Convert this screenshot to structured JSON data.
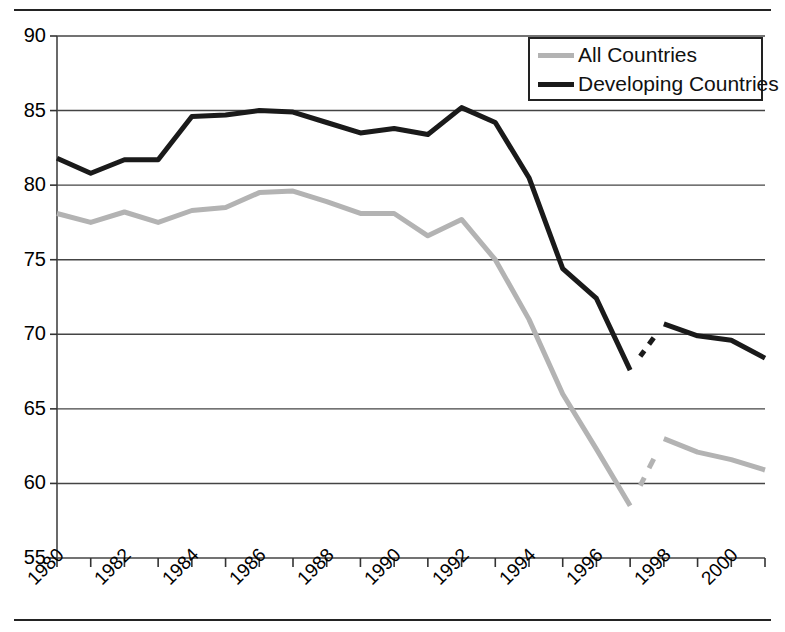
{
  "chart_data": {
    "type": "line",
    "title": "",
    "subtitle": "",
    "xlabel": "",
    "ylabel": "",
    "xlim": [
      1980,
      2001
    ],
    "ylim": [
      55,
      90
    ],
    "ytick_step": 5,
    "yticks": [
      55,
      60,
      65,
      70,
      75,
      80,
      85,
      90
    ],
    "xticks": [
      1980,
      1981,
      1982,
      1983,
      1984,
      1985,
      1986,
      1987,
      1988,
      1989,
      1990,
      1991,
      1992,
      1993,
      1994,
      1995,
      1996,
      1997,
      1998,
      1999,
      2000,
      2001
    ],
    "xtick_labels": [
      "1980",
      "1982",
      "1984",
      "1986",
      "1988",
      "1990",
      "1992",
      "1994",
      "1996",
      "1998",
      "2000"
    ],
    "xtick_labels_years": [
      1980,
      1982,
      1984,
      1986,
      1988,
      1990,
      1992,
      1994,
      1996,
      1998,
      2000
    ],
    "grid": "horizontal",
    "legend_position": "top-right",
    "series": [
      {
        "name": "All Countries",
        "color": "#b3b3b3",
        "linewidth": 5,
        "x": [
          1980,
          1981,
          1982,
          1983,
          1984,
          1985,
          1986,
          1987,
          1988,
          1989,
          1990,
          1991,
          1992,
          1993,
          1994,
          1995,
          1996,
          1997
        ],
        "values": [
          78.1,
          77.5,
          78.2,
          77.5,
          78.3,
          78.5,
          79.5,
          79.6,
          78.9,
          78.1,
          78.1,
          76.6,
          77.7,
          75.0,
          71.0,
          66.0,
          62.3,
          58.5
        ]
      },
      {
        "name": "All Countries (break)",
        "color": "#b3b3b3",
        "linewidth": 5,
        "x": [
          1998,
          1999,
          2000,
          2001
        ],
        "values": [
          63.0,
          62.1,
          61.6,
          60.9
        ]
      },
      {
        "name": "Developing Countries",
        "color": "#1a1a1a",
        "linewidth": 5,
        "x": [
          1980,
          1981,
          1982,
          1983,
          1984,
          1985,
          1986,
          1987,
          1988,
          1989,
          1990,
          1991,
          1992,
          1993,
          1994,
          1995,
          1996,
          1997
        ],
        "values": [
          81.8,
          80.8,
          81.7,
          81.7,
          84.6,
          84.7,
          85.0,
          84.9,
          84.2,
          83.5,
          83.8,
          83.4,
          85.2,
          84.2,
          80.5,
          74.4,
          72.4,
          67.6
        ]
      },
      {
        "name": "Developing Countries (break)",
        "color": "#1a1a1a",
        "linewidth": 5,
        "x": [
          1998,
          1999,
          2000,
          2001
        ],
        "values": [
          70.7,
          69.9,
          69.6,
          68.4
        ]
      }
    ]
  },
  "legend": {
    "items": [
      {
        "label": "All Countries",
        "color": "#b3b3b3"
      },
      {
        "label": "Developing Countries",
        "color": "#1a1a1a"
      }
    ]
  },
  "axes": {
    "y_labels": [
      "90",
      "85",
      "80",
      "75",
      "70",
      "65",
      "60",
      "55"
    ],
    "x_labels": [
      "1980",
      "1982",
      "1984",
      "1986",
      "1988",
      "1990",
      "1992",
      "1994",
      "1996",
      "1998",
      "2000"
    ]
  }
}
